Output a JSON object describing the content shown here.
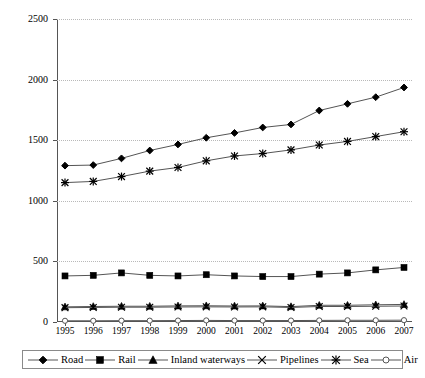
{
  "chart_data": {
    "type": "line",
    "title": "",
    "xlabel": "",
    "ylabel": "",
    "ylim": [
      0,
      2500
    ],
    "yticks": [
      0,
      500,
      1000,
      1500,
      2000,
      2500
    ],
    "ytick_labels": [
      "0",
      "500",
      "1000",
      "1500",
      "2000",
      "2500"
    ],
    "grid": true,
    "legend_position": "bottom",
    "categories": [
      "1995",
      "1996",
      "1997",
      "1998",
      "1999",
      "2000",
      "2001",
      "2002",
      "2003",
      "2004",
      "2005",
      "2006",
      "2007"
    ],
    "series": [
      {
        "name": "Road",
        "marker": "diamond",
        "values": [
          1290,
          1295,
          1350,
          1415,
          1465,
          1520,
          1560,
          1605,
          1630,
          1745,
          1800,
          1855,
          1935
        ]
      },
      {
        "name": "Rail",
        "marker": "square",
        "values": [
          380,
          385,
          405,
          385,
          380,
          390,
          380,
          375,
          375,
          395,
          405,
          430,
          450
        ]
      },
      {
        "name": "Inland waterways",
        "marker": "triangle",
        "values": [
          125,
          128,
          130,
          130,
          133,
          134,
          132,
          133,
          127,
          138,
          138,
          142,
          145
        ]
      },
      {
        "name": "Pipelines",
        "marker": "x",
        "values": [
          118,
          120,
          122,
          122,
          124,
          125,
          124,
          125,
          120,
          128,
          128,
          130,
          132
        ]
      },
      {
        "name": "Sea",
        "marker": "asterisk",
        "values": [
          1150,
          1160,
          1200,
          1245,
          1275,
          1330,
          1370,
          1390,
          1420,
          1460,
          1490,
          1530,
          1570
        ]
      },
      {
        "name": "Air",
        "marker": "open-circle",
        "values": [
          10,
          10,
          11,
          11,
          12,
          13,
          12,
          12,
          12,
          13,
          14,
          14,
          15
        ]
      }
    ]
  }
}
